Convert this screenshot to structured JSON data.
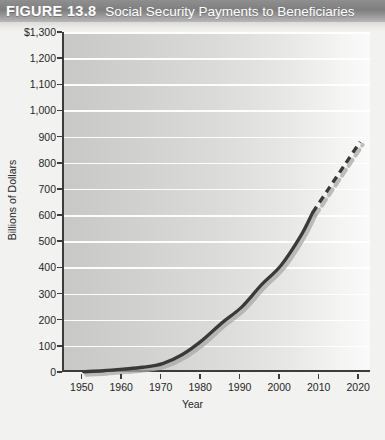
{
  "header": {
    "figure_number": "FIGURE 13.8",
    "title": "Social Security Payments to Beneficiaries"
  },
  "source": {
    "text": ""
  },
  "colors": {
    "header_band": "#8f8f8f",
    "header_text": "#ffffff",
    "plot_bg_left": "#c8c8c6",
    "plot_bg_right": "#fafafa",
    "gridline": "#ffffff",
    "axis": "#3c3c3c",
    "series_line": "#3a3a3a",
    "series_shadow": "#a8a8a6",
    "tick_label": "#262626"
  },
  "chart_data": {
    "type": "line",
    "title": "Social Security Payments to Beneficiaries",
    "xlabel": "Year",
    "ylabel": "Billions of Dollars",
    "xlim": [
      1945,
      2023
    ],
    "ylim": [
      0,
      1300
    ],
    "grid": true,
    "legend": "none",
    "ytick_labels": [
      "$1,300",
      "1,200",
      "1,100",
      "1,000",
      "900",
      "800",
      "700",
      "600",
      "500",
      "400",
      "300",
      "200",
      "100",
      "0"
    ],
    "ytick_values": [
      1300,
      1200,
      1100,
      1000,
      900,
      800,
      700,
      600,
      500,
      400,
      300,
      200,
      100,
      0
    ],
    "xtick_labels": [
      "1950",
      "1960",
      "1970",
      "1980",
      "1990",
      "2000",
      "2010",
      "2020"
    ],
    "xtick_values": [
      1950,
      1960,
      1970,
      1980,
      1990,
      2000,
      2010,
      2020
    ],
    "series": [
      {
        "name": "Actual payments",
        "style": "solid",
        "x": [
          1950,
          1955,
          1960,
          1965,
          1970,
          1975,
          1980,
          1985,
          1990,
          1995,
          2000,
          2005,
          2008
        ],
        "values": [
          1,
          5,
          11,
          18,
          32,
          67,
          121,
          188,
          248,
          333,
          408,
          521,
          610
        ]
      },
      {
        "name": "Projected payments",
        "style": "dashed",
        "x": [
          2008,
          2012,
          2016,
          2020
        ],
        "values": [
          610,
          700,
          790,
          880
        ]
      }
    ]
  }
}
